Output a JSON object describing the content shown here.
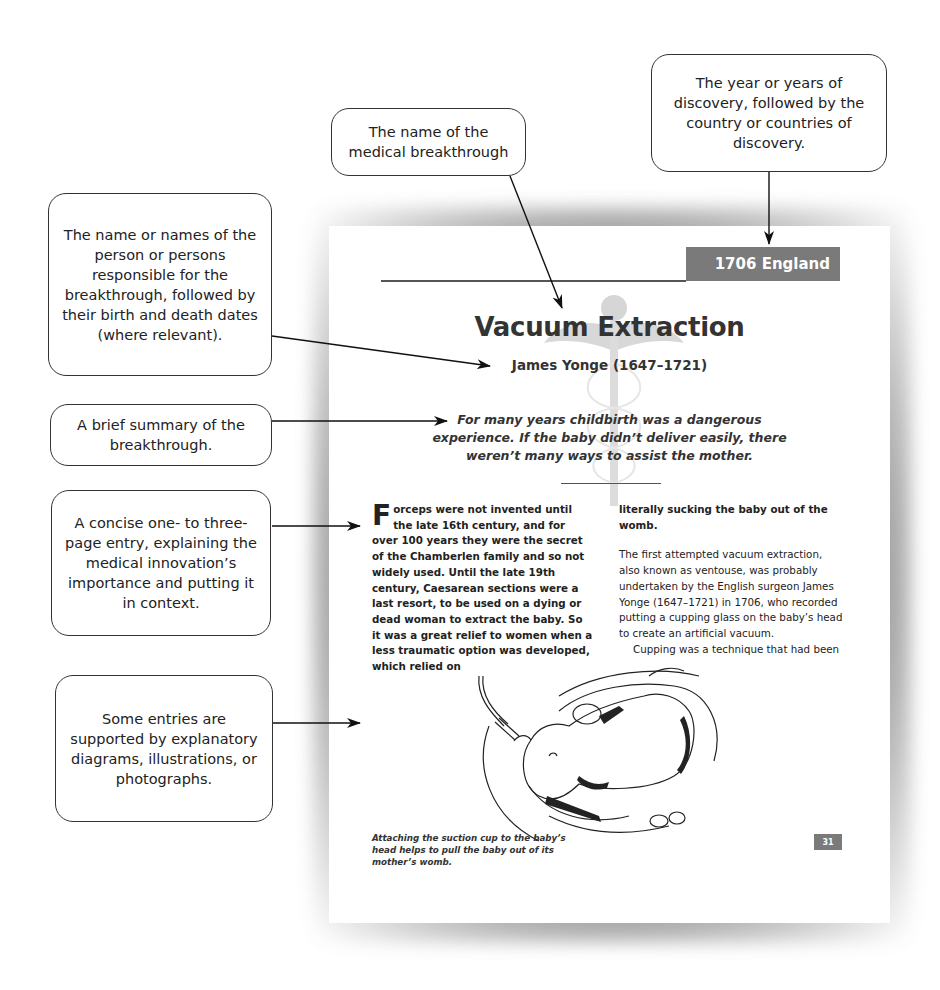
{
  "callouts": {
    "year_country": "The year or years of discovery, followed by the country or countries of discovery.",
    "name": "The name of the medical breakthrough",
    "persons": "The name or names of the person or persons responsible for the breakthrough, followed by their birth and death dates (where relevant).",
    "summary": "A brief summary of the breakthrough.",
    "entry": "A concise one- to three-page entry, explaining the medical innovation’s importance and putting it in context.",
    "illustrations": "Some entries are supported by explanatory diagrams, illustrations, or photographs."
  },
  "page": {
    "year_tag": "1706 England",
    "title": "Vacuum Extraction",
    "person": "James Yonge (1647–1721)",
    "summary": "For many years childbirth was a dangerous experience. If the baby didn’t deliver easily, there weren’t many ways to assist the mother.",
    "left_column": {
      "dropcap": "F",
      "text": "orceps were not invented until the late 16th century, and for over 100 years they were the secret of the Chamberlen family and so not widely used. Until the late 19th century, Caesarean sections were a last resort, to be used on a dying or dead woman to extract the baby. So it was a great relief to women when a less traumatic option was developed, which relied on"
    },
    "right_column": {
      "bold_continuation": "literally sucking the baby out of the womb.",
      "paragraph1": "The first attempted vacuum extraction, also known as ventouse, was probably undertaken by the English surgeon James Yonge (1647–1721) in 1706, who recorded putting a cupping glass on the baby’s head to create an artificial vacuum.",
      "paragraph2": "Cupping was a technique that had been"
    },
    "caption": "Attaching the suction cup to the baby’s head helps to pull the baby out of its mother’s womb.",
    "page_number": "31"
  },
  "colors": {
    "tag_gray": "#7a7a7a",
    "text_dark": "#333333",
    "caduceus_gray": "#d0d0d0"
  }
}
